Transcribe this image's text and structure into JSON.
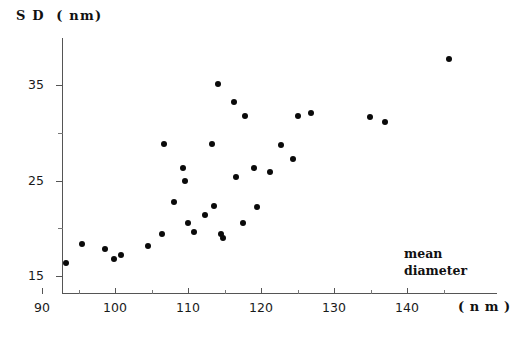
{
  "chart_data": {
    "type": "scatter",
    "title": "",
    "ylabel": "S D  ( nm)",
    "xlabel": "mean diameter",
    "xunit": "( n m )",
    "annotation_lines": [
      "mean",
      "diameter"
    ],
    "xlim": [
      88,
      148.5
    ],
    "ylim": [
      13.5,
      40
    ],
    "xticks": [
      90,
      100,
      110,
      120,
      130,
      140
    ],
    "xticks_minor": [
      95,
      105,
      115,
      125,
      135,
      145
    ],
    "yticks": [
      15,
      25,
      35
    ],
    "yticks_minor": [
      20,
      30
    ],
    "grid": false,
    "legend": "none",
    "marker": "filled-circle",
    "marker_color": "#0a0a0a",
    "points": [
      {
        "x": 93.3,
        "y": 16.4
      },
      {
        "x": 95.5,
        "y": 18.4
      },
      {
        "x": 98.6,
        "y": 17.8
      },
      {
        "x": 99.9,
        "y": 16.8
      },
      {
        "x": 100.8,
        "y": 17.2
      },
      {
        "x": 104.5,
        "y": 18.1
      },
      {
        "x": 106.4,
        "y": 19.4
      },
      {
        "x": 106.7,
        "y": 28.8
      },
      {
        "x": 108.1,
        "y": 22.7
      },
      {
        "x": 109.3,
        "y": 26.3
      },
      {
        "x": 109.6,
        "y": 24.9
      },
      {
        "x": 110.0,
        "y": 20.6
      },
      {
        "x": 110.8,
        "y": 19.6
      },
      {
        "x": 112.3,
        "y": 21.4
      },
      {
        "x": 113.3,
        "y": 28.8
      },
      {
        "x": 113.5,
        "y": 22.3
      },
      {
        "x": 114.1,
        "y": 35.1
      },
      {
        "x": 114.5,
        "y": 19.4
      },
      {
        "x": 114.8,
        "y": 19.0
      },
      {
        "x": 116.3,
        "y": 33.2
      },
      {
        "x": 116.6,
        "y": 25.4
      },
      {
        "x": 117.8,
        "y": 31.8
      },
      {
        "x": 117.6,
        "y": 20.5
      },
      {
        "x": 119.0,
        "y": 26.3
      },
      {
        "x": 119.4,
        "y": 22.2
      },
      {
        "x": 121.2,
        "y": 25.9
      },
      {
        "x": 122.7,
        "y": 28.7
      },
      {
        "x": 124.4,
        "y": 27.3
      },
      {
        "x": 125.0,
        "y": 31.8
      },
      {
        "x": 126.9,
        "y": 32.1
      },
      {
        "x": 134.9,
        "y": 31.6
      },
      {
        "x": 137.0,
        "y": 31.1
      },
      {
        "x": 145.8,
        "y": 37.7
      }
    ]
  }
}
